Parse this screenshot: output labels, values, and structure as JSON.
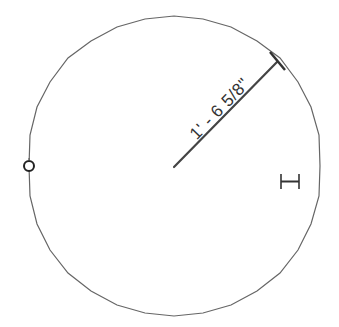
{
  "drawing": {
    "circle": {
      "cx": 174,
      "cy": 166,
      "r": 146,
      "stroke": "#555555"
    },
    "radius_line": {
      "x1": 174,
      "y1": 167,
      "x2": 276,
      "y2": 63,
      "stroke": "#444444"
    },
    "dimension_label": "1' - 6 5/8\"",
    "grip": {
      "shape": "circle-grip",
      "cx": 29,
      "cy": 166,
      "r": 5
    },
    "cursor": {
      "icon": "dimension-cursor-icon",
      "x": 280,
      "y": 174
    }
  }
}
